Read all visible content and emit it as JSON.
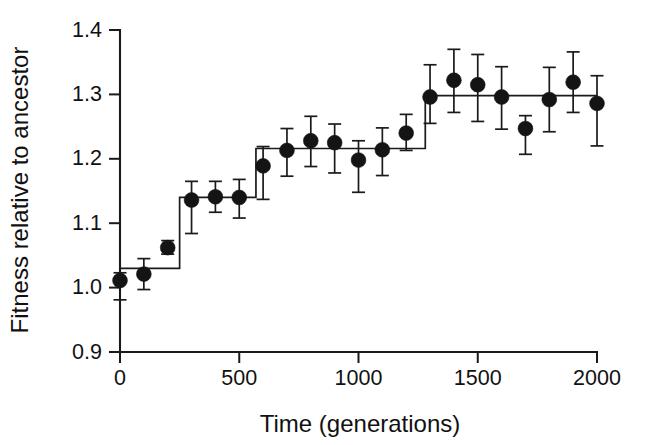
{
  "chart_data": {
    "type": "scatter",
    "title": "",
    "xlabel": "Time (generations)",
    "ylabel": "Fitness relative to ancestor",
    "xlim": [
      0,
      2000
    ],
    "ylim": [
      0.9,
      1.4
    ],
    "xticks": [
      0,
      500,
      1000,
      1500,
      2000
    ],
    "xtick_labels": [
      "0",
      "500",
      "1000",
      "1500",
      "2000"
    ],
    "yticks": [
      0.9,
      1.0,
      1.1,
      1.2,
      1.3,
      1.4
    ],
    "ytick_labels": [
      "0.9",
      "1.0",
      "1.1",
      "1.2",
      "1.3",
      "1.4"
    ],
    "grid": false,
    "legend": "none",
    "marker_style": "filled-circle",
    "error_bar_style": "capped-vertical",
    "x": [
      0,
      100,
      200,
      300,
      400,
      500,
      600,
      700,
      800,
      900,
      1000,
      1100,
      1200,
      1300,
      1400,
      1500,
      1600,
      1700,
      1800,
      1900,
      2000
    ],
    "y": [
      1.011,
      1.021,
      1.062,
      1.136,
      1.141,
      1.14,
      1.189,
      1.213,
      1.228,
      1.225,
      1.198,
      1.214,
      1.24,
      1.296,
      1.322,
      1.315,
      1.296,
      1.247,
      1.292,
      1.319,
      1.286
    ],
    "yerr_lower": [
      0.03,
      0.024,
      0.01,
      0.052,
      0.024,
      0.032,
      0.052,
      0.04,
      0.04,
      0.047,
      0.05,
      0.04,
      0.027,
      0.041,
      0.05,
      0.057,
      0.05,
      0.04,
      0.05,
      0.047,
      0.066
    ],
    "yerr_upper": [
      0.012,
      0.024,
      0.011,
      0.029,
      0.024,
      0.028,
      0.03,
      0.034,
      0.038,
      0.029,
      0.03,
      0.034,
      0.029,
      0.05,
      0.048,
      0.047,
      0.047,
      0.02,
      0.05,
      0.047,
      0.043
    ],
    "series": [
      {
        "name": "Mean fitness with 95% confidence interval",
        "values": [
          1.011,
          1.021,
          1.062,
          1.136,
          1.141,
          1.14,
          1.189,
          1.213,
          1.228,
          1.225,
          1.198,
          1.214,
          1.24,
          1.296,
          1.322,
          1.315,
          1.296,
          1.247,
          1.292,
          1.319,
          1.286
        ]
      },
      {
        "name": "Step model fit",
        "type": "step",
        "breakpoints": [
          0,
          250,
          570,
          1280,
          2000
        ],
        "levels": [
          1.03,
          1.14,
          1.216,
          1.298
        ]
      }
    ]
  },
  "axes": {
    "x_title": "Time (generations)",
    "y_title": "Fitness relative to ancestor"
  }
}
